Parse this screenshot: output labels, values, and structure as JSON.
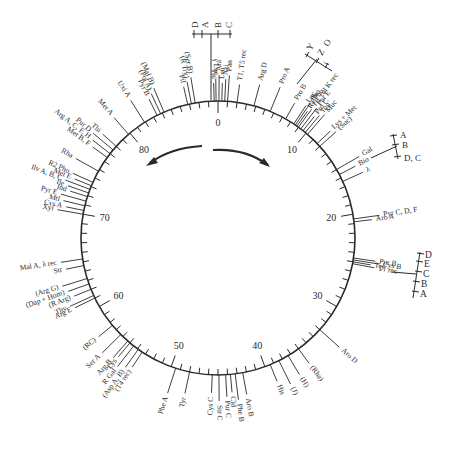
{
  "diagram": {
    "title": "",
    "total_minutes": 90,
    "center": [
      218,
      238
    ],
    "radius": 137,
    "major_ticks": [
      {
        "minute": 0,
        "label": "0"
      },
      {
        "minute": 10,
        "label": "10"
      },
      {
        "minute": 20,
        "label": "20"
      },
      {
        "minute": 30,
        "label": "30"
      },
      {
        "minute": 40,
        "label": "40"
      },
      {
        "minute": 50,
        "label": "50"
      },
      {
        "minute": 60,
        "label": "60"
      },
      {
        "minute": 70,
        "label": "70"
      },
      {
        "minute": 80,
        "label": "80"
      }
    ],
    "direction_arrows": [
      "clockwise",
      "counterclockwise"
    ],
    "colors": {
      "line": "#2a2a2a",
      "background": "#ffffff"
    },
    "genes": [
      {
        "label": "Thi",
        "minute": 89.6
      },
      {
        "label": "γ Lac",
        "minute": 89.8
      },
      {
        "label": "Ara",
        "minute": 0.1
      },
      {
        "label": "Leu",
        "minute": 0.4
      },
      {
        "label": "Azi",
        "minute": 0.7
      },
      {
        "label": "Pan",
        "minute": 1.0
      },
      {
        "label": "T1, T5 rec",
        "minute": 2.0
      },
      {
        "label": "Arg D",
        "minute": 3.8
      },
      {
        "label": "Pro A",
        "minute": 5.6
      },
      {
        "label": "Pro B",
        "minute": 7.4
      },
      {
        "label": "Lac",
        "minute": 8.4
      },
      {
        "label": "Pho",
        "minute": 8.6
      },
      {
        "label": "R1 Pho",
        "minute": 8.8
      },
      {
        "label": "T6, col K rec",
        "minute": 9.0
      },
      {
        "label": "Pur E",
        "minute": 9.3
      },
      {
        "label": "Pro C",
        "minute": 9.6
      },
      {
        "label": "Ton",
        "minute": 9.9
      },
      {
        "label": "Muc",
        "minute": 10.2
      },
      {
        "label": "Lys + Met",
        "minute": 11.6
      },
      {
        "label": "(Suc)",
        "minute": 12.0
      },
      {
        "label": "Gal",
        "minute": 15.0
      },
      {
        "label": "Bio",
        "minute": 15.6
      },
      {
        "label": "λ",
        "minute": 16.4
      },
      {
        "label": "Pyr C, D, F",
        "minute": 20.5
      },
      {
        "label": "Aro A",
        "minute": 20.8
      },
      {
        "label": "Pur B",
        "minute": 24.6
      },
      {
        "label": "Cys B",
        "minute": 24.8
      },
      {
        "label": "Try",
        "minute": 25.0
      },
      {
        "label": "T1 rec",
        "minute": 25.2
      },
      {
        "label": "Aro D",
        "minute": 33.0
      },
      {
        "label": "(Rha)",
        "minute": 36.0
      },
      {
        "label": "(H)",
        "minute": 37.3
      },
      {
        "label": "(J)",
        "minute": 38.4
      },
      {
        "label": "His",
        "minute": 39.4
      },
      {
        "label": "Aro B",
        "minute": 42.4
      },
      {
        "label": "Phe B",
        "minute": 43.2
      },
      {
        "label": "Cld",
        "minute": 43.7
      },
      {
        "label": "Pur C",
        "minute": 44.2
      },
      {
        "label": "Str C",
        "minute": 44.9
      },
      {
        "label": "Cys C",
        "minute": 45.6
      },
      {
        "label": "Tyr",
        "minute": 48.0
      },
      {
        "label": "Phe A",
        "minute": 49.5
      },
      {
        "label": "(T4 rec)",
        "minute": 53.4
      },
      {
        "label": "(Asp A, B)",
        "minute": 53.9
      },
      {
        "label": "R Gal",
        "minute": 54.5
      },
      {
        "label": "Lys",
        "minute": 55.0
      },
      {
        "label": "Arg B",
        "minute": 55.3
      },
      {
        "label": "Ser A",
        "minute": 56.3
      },
      {
        "label": "(RC)",
        "minute": 57.6
      },
      {
        "label": "Arg E",
        "minute": 61.0
      },
      {
        "label": "Thy",
        "minute": 61.3
      },
      {
        "label": "(R Arg)",
        "minute": 62.0
      },
      {
        "label": "(Dap + Hom)",
        "minute": 62.6
      },
      {
        "label": "(Arg G)",
        "minute": 63.2
      },
      {
        "label": "Str",
        "minute": 64.6
      },
      {
        "label": "Mal A, λ rec",
        "minute": 65.3
      },
      {
        "label": "Xyl",
        "minute": 70.0
      },
      {
        "label": "Cys A",
        "minute": 70.4
      },
      {
        "label": "Mtl",
        "minute": 70.9
      },
      {
        "label": "Pyr E",
        "minute": 71.4
      },
      {
        "label": "Ind",
        "minute": 71.9
      },
      {
        "label": "Ile",
        "minute": 72.3
      },
      {
        "label": "Ilv A, B, C",
        "minute": 72.7
      },
      {
        "label": "Met E",
        "minute": 73.1
      },
      {
        "label": "R2 Pho",
        "minute": 73.5
      },
      {
        "label": "Rha",
        "minute": 74.8
      },
      {
        "label": "Met B, F",
        "minute": 76.5
      },
      {
        "label": "Arg A, C, F, H",
        "minute": 77.0
      },
      {
        "label": "Pur D",
        "minute": 77.5
      },
      {
        "label": "Thi",
        "minute": 78.0
      },
      {
        "label": "Met A",
        "minute": 79.8
      },
      {
        "label": "Uxi A",
        "minute": 81.9
      },
      {
        "label": "Pyr B",
        "minute": 83.4
      },
      {
        "label": "(Pol A)",
        "minute": 83.8
      },
      {
        "label": "(Mal B)",
        "minute": 84.2
      },
      {
        "label": "Pil",
        "minute": 86.8
      },
      {
        "label": "(R Try)",
        "minute": 87.2
      },
      {
        "label": "(Ser B)",
        "minute": 87.6
      }
    ],
    "operons": [
      {
        "name": "ara-operon",
        "genes": [
          "D",
          "A",
          "B",
          "C"
        ]
      },
      {
        "name": "lac-operon",
        "genes": [
          "Y",
          "Z",
          "O",
          "i"
        ]
      },
      {
        "name": "gal-operon",
        "genes": [
          "A",
          "B",
          "D, C"
        ]
      },
      {
        "name": "try-operon",
        "genes": [
          "D",
          "E",
          "C",
          "B",
          "A"
        ]
      }
    ]
  }
}
